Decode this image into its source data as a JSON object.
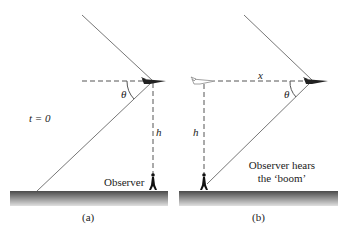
{
  "panel_a": {
    "caption": "(a)",
    "time_label": "t = 0",
    "angle_label": "θ",
    "height_label": "h",
    "observer_label": "Observer"
  },
  "panel_b": {
    "caption": "(b)",
    "distance_label": "x",
    "angle_label": "θ",
    "height_label": "h",
    "observer_label_line1": "Observer hears",
    "observer_label_line2": "the ‘boom’"
  },
  "colors": {
    "line": "#777777",
    "ground_top": "#555555",
    "ground_bottom": "#dddddd",
    "text": "#222222"
  }
}
